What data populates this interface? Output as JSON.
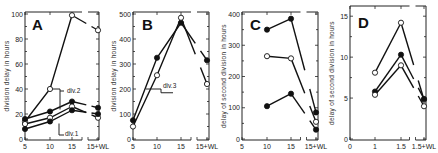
{
  "chart_data": [
    {
      "panel": "A",
      "type": "line",
      "title": "A",
      "xlabel": "",
      "ylabel": "division delay in hours",
      "categories": [
        "5",
        "10",
        "15",
        "15+WL"
      ],
      "ylim": [
        0,
        100
      ],
      "yticks": [
        0,
        20,
        40,
        60,
        80,
        100
      ],
      "grid": false,
      "series": [
        {
          "name": "div.2 (upper, open)",
          "marker": "open",
          "values": [
            14,
            40,
            99,
            87
          ]
        },
        {
          "name": "div.2 (filled)",
          "marker": "filled",
          "values": [
            16,
            22,
            30,
            25
          ]
        },
        {
          "name": "div.1 (open)",
          "marker": "open",
          "values": [
            12,
            17,
            26,
            17
          ]
        },
        {
          "name": "div.1 (filled)",
          "marker": "filled",
          "values": [
            8,
            14,
            23,
            20
          ]
        }
      ],
      "annotations": [
        "div.2",
        "div.1"
      ]
    },
    {
      "panel": "B",
      "type": "line",
      "title": "B",
      "xlabel": "",
      "ylabel": "division delay in hours",
      "categories": [
        "5",
        "10",
        "15",
        "15+WL"
      ],
      "ylim": [
        0,
        500
      ],
      "yticks": [
        0,
        100,
        200,
        300,
        400,
        500
      ],
      "grid": false,
      "series": [
        {
          "name": "div.3 (filled)",
          "marker": "filled",
          "values": [
            75,
            325,
            465,
            315
          ]
        },
        {
          "name": "div.3 (open)",
          "marker": "open",
          "values": [
            50,
            255,
            485,
            220
          ]
        }
      ],
      "annotations": [
        "div.3"
      ]
    },
    {
      "panel": "C",
      "type": "line",
      "title": "C",
      "xlabel": "",
      "ylabel": "delay of second division in hours",
      "categories": [
        "5",
        "10",
        "15",
        "15+WL"
      ],
      "ylim": [
        0,
        400
      ],
      "yticks": [
        0,
        100,
        200,
        300,
        400
      ],
      "grid": false,
      "series": [
        {
          "name": "upper (filled)",
          "marker": "filled",
          "values": [
            null,
            350,
            385,
            85
          ]
        },
        {
          "name": "middle (open)",
          "marker": "open",
          "values": [
            null,
            265,
            258,
            55
          ]
        },
        {
          "name": "lower (filled)",
          "marker": "filled",
          "values": [
            null,
            105,
            145,
            30
          ]
        }
      ]
    },
    {
      "panel": "D",
      "type": "line",
      "title": "D",
      "xlabel": "",
      "ylabel": "delay of second division in hours",
      "categories": [
        "0",
        "1",
        "1.5",
        "1.5+WL"
      ],
      "ylim": [
        0,
        16
      ],
      "yticks": [
        5,
        10,
        15
      ],
      "grid": false,
      "series": [
        {
          "name": "upper (open)",
          "marker": "open",
          "values": [
            null,
            8.1,
            14.2,
            4.8
          ]
        },
        {
          "name": "middle (filled)",
          "marker": "filled",
          "values": [
            null,
            5.8,
            10.3,
            4.9
          ]
        },
        {
          "name": "lower (open)",
          "marker": "open",
          "values": [
            null,
            5.4,
            9.0,
            4.0
          ]
        }
      ]
    }
  ],
  "panels": {
    "A": {
      "letter": "A",
      "ylabel": "division delay in hours",
      "annot_div2": "div.2",
      "annot_div1": "div.1"
    },
    "B": {
      "letter": "B",
      "ylabel": "division delay in hours",
      "annot_div3": "div.3"
    },
    "C": {
      "letter": "C",
      "ylabel": "delay of second division in hours"
    },
    "D": {
      "letter": "D",
      "ylabel": "delay of second division in hours"
    }
  }
}
